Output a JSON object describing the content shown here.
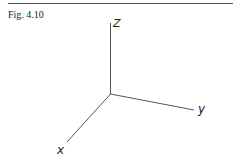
{
  "figure": {
    "caption": "Fig. 4.10",
    "type": "3D coordinate axes",
    "axes": {
      "z": {
        "label": "Z",
        "direction": "up"
      },
      "y": {
        "label": "y",
        "direction": "right-down"
      },
      "x": {
        "label": "x",
        "direction": "left-down"
      }
    }
  },
  "colors": {
    "line": "#555555",
    "text": "#222222",
    "background": "#ffffff"
  }
}
